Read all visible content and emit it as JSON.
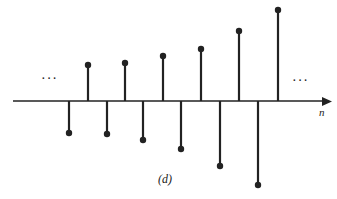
{
  "figure": {
    "caption": "(d)",
    "axis_label": "n",
    "ellipsis_left": "···",
    "ellipsis_right": "···",
    "stroke_color": "#222222",
    "background": "#ffffff"
  },
  "chart_data": {
    "type": "stem",
    "title": "",
    "caption": "(d)",
    "xlabel": "n",
    "ylabel": "",
    "grid": false,
    "x": [
      1,
      2,
      3,
      4,
      5,
      6,
      7,
      8,
      9,
      10,
      11,
      12
    ],
    "values": [
      -32,
      36,
      -33,
      38,
      -39,
      45,
      -48,
      52,
      -65,
      70,
      -84,
      91
    ],
    "axis_y_px": 101,
    "x_px": [
      69,
      88,
      107,
      125,
      143,
      163,
      181,
      201,
      220,
      239,
      258,
      278
    ]
  }
}
